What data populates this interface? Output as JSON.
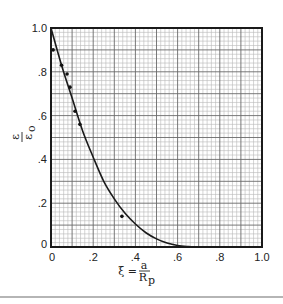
{
  "chart_data": {
    "type": "line",
    "title": "",
    "xlabel": "ξ = a / R_p",
    "ylabel": "ε/ε₀",
    "xlim": [
      0,
      1.0
    ],
    "ylim": [
      0,
      1.0
    ],
    "grid": true,
    "grid_minor_step": 0.02,
    "grid_major_step": 0.1,
    "x_ticks": [
      {
        "value": 0,
        "label": "0"
      },
      {
        "value": 0.2,
        "label": ".2"
      },
      {
        "value": 0.4,
        "label": ".4"
      },
      {
        "value": 0.6,
        "label": ".6"
      },
      {
        "value": 0.8,
        "label": ".8"
      },
      {
        "value": 1.0,
        "label": "1.0"
      }
    ],
    "y_ticks": [
      {
        "value": 0,
        "label": "0"
      },
      {
        "value": 0.2,
        "label": ".2"
      },
      {
        "value": 0.4,
        "label": ".4"
      },
      {
        "value": 0.6,
        "label": ".6"
      },
      {
        "value": 0.8,
        "label": ".8"
      },
      {
        "value": 1.0,
        "label": "1.0"
      }
    ],
    "series": [
      {
        "name": "theory curve",
        "kind": "line",
        "x": [
          0.0,
          0.05,
          0.1,
          0.15,
          0.2,
          0.25,
          0.3,
          0.35,
          0.4,
          0.45,
          0.5,
          0.55,
          0.6,
          0.65,
          0.69
        ],
        "y": [
          1.0,
          0.83,
          0.68,
          0.53,
          0.41,
          0.3,
          0.22,
          0.155,
          0.105,
          0.065,
          0.037,
          0.018,
          0.007,
          0.002,
          0.0
        ]
      },
      {
        "name": "measured",
        "kind": "scatter",
        "x": [
          0.01,
          0.05,
          0.076,
          0.09,
          0.114,
          0.137,
          0.336
        ],
        "y": [
          0.9,
          0.83,
          0.79,
          0.73,
          0.62,
          0.56,
          0.14
        ]
      }
    ]
  },
  "labels": {
    "x_main": "ξ = ",
    "x_num": "a",
    "x_den": "R",
    "x_den_sub": "p",
    "y_num": "ε",
    "y_den": "ε",
    "y_den_sub": "o"
  }
}
